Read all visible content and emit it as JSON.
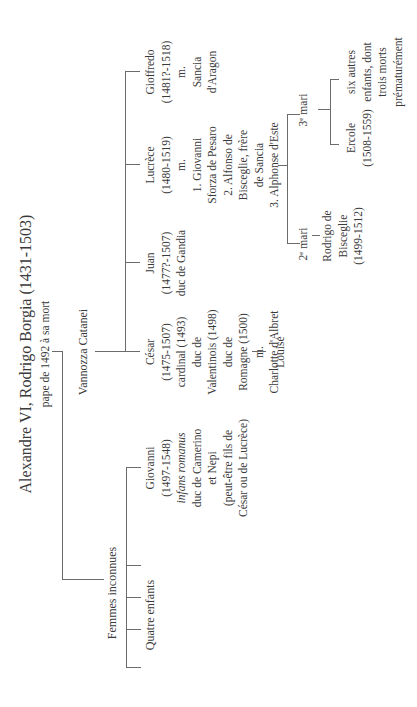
{
  "root": {
    "name": "Alexandre VI, Rodrigo Borgia (1431-1503)",
    "subtitle": "pape de 1492 à sa mort"
  },
  "partners": [
    {
      "name": "Vannozza Catanei",
      "children": [
        {
          "lines": [
            "César",
            "(1475-1507)",
            "cardinal (1493)",
            "duc de",
            "Valentinois (1498)",
            "duc de",
            "Romagne (1500)",
            "m.",
            "Charlotte d'Albret"
          ],
          "children": [
            {
              "name": "Louise"
            }
          ]
        },
        {
          "lines": [
            "Juan",
            "(1477?-1507)",
            "duc de Gandia"
          ]
        },
        {
          "lines": [
            "Lucrèce",
            "(1480-1519)",
            "m.",
            "1. Giovanni",
            "Sforza de Pesaro",
            "2. Alfonso de",
            "Bisceglie, frère",
            "de Sancia",
            "3. Alphonse d'Este"
          ],
          "marriages": [
            {
              "label": "2",
              "label_sup": "e",
              "label_rest": " mari",
              "children": [
                {
                  "lines": [
                    "Rodrigo de",
                    "Bisceglie",
                    "(1499-1512)"
                  ]
                }
              ]
            },
            {
              "label": "3",
              "label_sup": "e",
              "label_rest": " mari",
              "children": [
                {
                  "lines": [
                    "Ercole",
                    "(1508-1559)"
                  ]
                },
                {
                  "lines": [
                    "six autres",
                    "enfants, dont",
                    "trois morts",
                    "prématurément"
                  ]
                }
              ]
            }
          ]
        },
        {
          "lines": [
            "Gioffredo",
            "(1481?-1518)",
            "m.",
            "Sancia",
            "d'Aragon"
          ]
        }
      ]
    },
    {
      "name": "Femmes inconnues",
      "children": [
        {
          "lines": [
            "Giovanni",
            "(1497-1548)",
            "infans romanus",
            "duc de Camerino",
            "et Nepi",
            "(peut-être fils de",
            "César ou de Lucrèce)"
          ],
          "italic_line_index": 2
        }
      ],
      "other_children_label": "Quatre enfants"
    }
  ],
  "colors": {
    "line": "#6b6b6b",
    "text": "#3a3a3a",
    "background": "#ffffff"
  }
}
